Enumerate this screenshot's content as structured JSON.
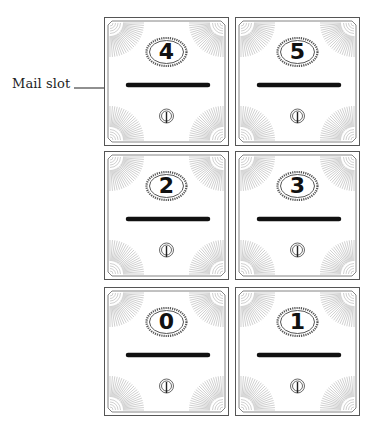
{
  "annotation": {
    "label": "Mail slot",
    "target_box": "4"
  },
  "mailboxes": [
    {
      "number": "4",
      "row": 0,
      "col": 0
    },
    {
      "number": "5",
      "row": 0,
      "col": 1
    },
    {
      "number": "2",
      "row": 1,
      "col": 0
    },
    {
      "number": "3",
      "row": 1,
      "col": 1
    },
    {
      "number": "0",
      "row": 2,
      "col": 0
    },
    {
      "number": "1",
      "row": 2,
      "col": 1
    }
  ],
  "colors": {
    "stroke": "#555555",
    "slot": "#111111",
    "rays": "#9a9a9a"
  }
}
